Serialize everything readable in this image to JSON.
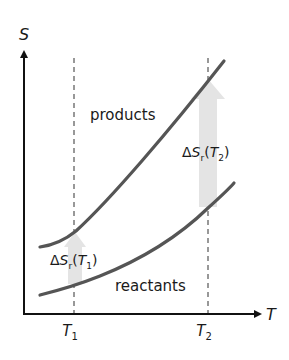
{
  "diagram": {
    "type": "entropy-vs-temperature",
    "axes": {
      "y_label": "S",
      "x_label": "T"
    },
    "temperatures": [
      {
        "label": "T",
        "subscript": "1"
      },
      {
        "label": "T",
        "subscript": "2"
      }
    ],
    "curves": [
      {
        "name": "products",
        "label": "products",
        "color": "#555555"
      },
      {
        "name": "reactants",
        "label": "reactants",
        "color": "#555555"
      }
    ],
    "annotations": [
      {
        "delta": "Δ",
        "symbol": "S",
        "subscript": "r",
        "open": "(",
        "temp": "T",
        "temp_subscript": "1",
        "close": ")"
      },
      {
        "delta": "Δ",
        "symbol": "S",
        "subscript": "r",
        "open": "(",
        "temp": "T",
        "temp_subscript": "2",
        "close": ")"
      }
    ],
    "colors": {
      "axis": "#111111",
      "curve": "#555555",
      "dashed": "#777777",
      "arrow_fill": "#e4e4e4"
    }
  }
}
